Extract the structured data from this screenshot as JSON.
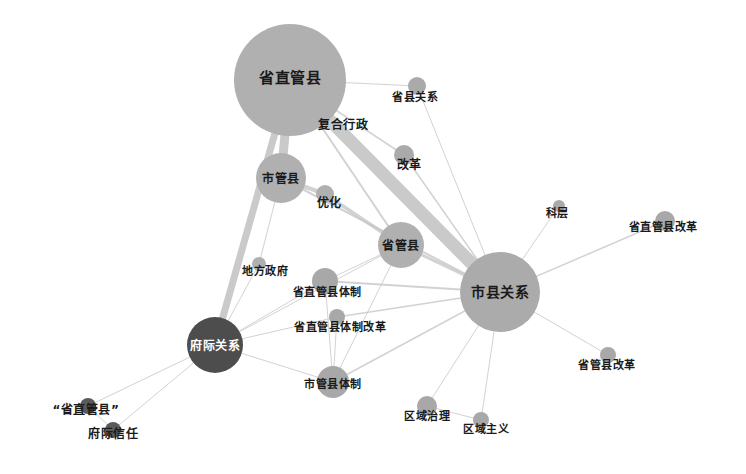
{
  "figure": {
    "type": "network-graph",
    "width": 746,
    "height": 474,
    "background": "#ffffff",
    "node_fill_light": "#b3b3b3",
    "node_fill_mid": "#9c9c9c",
    "node_fill_dark": "#4d4d4d",
    "edge_color": "#c8c8c8",
    "label_color": "#1a1a1a",
    "label_color_inverse": "#ffffff"
  },
  "chart_data": {
    "type": "network",
    "title": "",
    "nodes": [
      {
        "id": "sheng_zhi_guan_xian",
        "label": "省直管县",
        "x": 290,
        "y": 80,
        "r": 56,
        "fill": "#b0b0b0",
        "label_x": 290,
        "label_y": 76,
        "font_size": 15,
        "text_color": "dark"
      },
      {
        "id": "shi_guan_xian",
        "label": "市管县",
        "x": 281,
        "y": 178,
        "r": 25,
        "fill": "#b0b0b0",
        "label_x": 281,
        "label_y": 177,
        "font_size": 12,
        "text_color": "dark"
      },
      {
        "id": "sheng_guan_xian",
        "label": "省管县",
        "x": 401,
        "y": 245,
        "r": 23,
        "fill": "#b0b0b0",
        "label_x": 401,
        "label_y": 244,
        "font_size": 12,
        "text_color": "dark"
      },
      {
        "id": "shi_xian_guan_xi",
        "label": "市县关系",
        "x": 500,
        "y": 292,
        "r": 40,
        "fill": "#ababab",
        "label_x": 500,
        "label_y": 291,
        "font_size": 14,
        "text_color": "dark"
      },
      {
        "id": "fu_ji_guan_xi",
        "label": "府际关系",
        "x": 215,
        "y": 345,
        "r": 28,
        "fill": "#4d4d4d",
        "label_x": 215,
        "label_y": 344,
        "font_size": 12,
        "text_color": "light"
      },
      {
        "id": "sheng_xian_guan_xi",
        "label": "省县关系",
        "x": 417,
        "y": 86,
        "r": 9,
        "fill": "#aaaaaa",
        "label_x": 415,
        "label_y": 96,
        "font_size": 11,
        "text_color": "dark"
      },
      {
        "id": "gai_ge",
        "label": "改革",
        "x": 404,
        "y": 155,
        "r": 10,
        "fill": "#aaaaaa",
        "label_x": 409,
        "label_y": 163,
        "font_size": 12,
        "text_color": "dark"
      },
      {
        "id": "you_hua",
        "label": "优化",
        "x": 325,
        "y": 194,
        "r": 9,
        "fill": "#b0b0b0",
        "label_x": 329,
        "label_y": 201,
        "font_size": 12,
        "text_color": "dark"
      },
      {
        "id": "ke_ceng",
        "label": "科层",
        "x": 559,
        "y": 206,
        "r": 6,
        "fill": "#aaaaaa",
        "label_x": 557,
        "label_y": 212,
        "font_size": 11,
        "text_color": "dark"
      },
      {
        "id": "sheng_zhi_guan_xian_gai_ge",
        "label": "省直管县改革",
        "x": 665,
        "y": 221,
        "r": 10,
        "fill": "#a8a8a8",
        "label_x": 663,
        "label_y": 226,
        "font_size": 11,
        "text_color": "dark"
      },
      {
        "id": "di_fang_zheng_fu",
        "label": "地方政府",
        "x": 259,
        "y": 264,
        "r": 7,
        "fill": "#b0b0b0",
        "label_x": 265,
        "label_y": 270,
        "font_size": 11,
        "text_color": "dark"
      },
      {
        "id": "szgx_ti_zhi",
        "label": "省直管县体制",
        "x": 325,
        "y": 281,
        "r": 13,
        "fill": "#a8a8a8",
        "label_x": 327,
        "label_y": 291,
        "font_size": 11,
        "text_color": "dark"
      },
      {
        "id": "szgx_ti_zhi_gai_ge",
        "label": "省直管县体制改革",
        "x": 337,
        "y": 317,
        "r": 8,
        "fill": "#a8a8a8",
        "label_x": 340,
        "label_y": 326,
        "font_size": 11,
        "text_color": "dark"
      },
      {
        "id": "sgx_gai_ge",
        "label": "省管县改革",
        "x": 608,
        "y": 355,
        "r": 8,
        "fill": "#a8a8a8",
        "label_x": 607,
        "label_y": 364,
        "font_size": 11,
        "text_color": "dark"
      },
      {
        "id": "shi_guan_xian_ti_zhi",
        "label": "市管县体制",
        "x": 333,
        "y": 382,
        "r": 16,
        "fill": "#a8a8a8",
        "label_x": 333,
        "label_y": 383,
        "font_size": 11,
        "text_color": "dark"
      },
      {
        "id": "qu_yu_zhi_li",
        "label": "区域治理",
        "x": 427,
        "y": 406,
        "r": 10,
        "fill": "#a8a8a8",
        "label_x": 427,
        "label_y": 415,
        "font_size": 11,
        "text_color": "dark"
      },
      {
        "id": "qu_yu_zhu_yi",
        "label": "区域主义",
        "x": 481,
        "y": 420,
        "r": 8,
        "fill": "#a8a8a8",
        "label_x": 486,
        "label_y": 428,
        "font_size": 11,
        "text_color": "dark"
      },
      {
        "id": "szgx_quoted",
        "label": "“省直管县”",
        "x": 88,
        "y": 406,
        "r": 8,
        "fill": "#5a5a5a",
        "label_x": 86,
        "label_y": 408,
        "font_size": 12,
        "text_color": "dark"
      },
      {
        "id": "fu_ji_xin_ren",
        "label": "府际信任",
        "x": 113,
        "y": 430,
        "r": 8,
        "fill": "#5a5a5a",
        "label_x": 113,
        "label_y": 432,
        "font_size": 12,
        "text_color": "dark"
      },
      {
        "id": "fu_he_xing_zheng",
        "label": "复合行政",
        "x": 352,
        "y": 131,
        "r": 0,
        "fill": "#b0b0b0",
        "label_x": 343,
        "label_y": 123,
        "font_size": 12,
        "text_color": "dark"
      }
    ],
    "edges": [
      {
        "source": "sheng_zhi_guan_xian",
        "target": "shi_xian_guan_xi",
        "width": 13
      },
      {
        "source": "sheng_zhi_guan_xian",
        "target": "shi_guan_xian",
        "width": 9
      },
      {
        "source": "sheng_zhi_guan_xian",
        "target": "fu_ji_guan_xi",
        "width": 7
      },
      {
        "source": "sheng_zhi_guan_xian",
        "target": "sheng_guan_xian",
        "width": 2
      },
      {
        "source": "sheng_zhi_guan_xian",
        "target": "sheng_xian_guan_xi",
        "width": 1
      },
      {
        "source": "sheng_zhi_guan_xian",
        "target": "gai_ge",
        "width": 1.5
      },
      {
        "source": "shi_guan_xian",
        "target": "you_hua",
        "width": 4
      },
      {
        "source": "you_hua",
        "target": "sheng_guan_xian",
        "width": 3.5
      },
      {
        "source": "shi_guan_xian",
        "target": "shi_xian_guan_xi",
        "width": 2
      },
      {
        "source": "sheng_guan_xian",
        "target": "shi_xian_guan_xi",
        "width": 3
      },
      {
        "source": "gai_ge",
        "target": "shi_xian_guan_xi",
        "width": 1.5
      },
      {
        "source": "sheng_xian_guan_xi",
        "target": "shi_xian_guan_xi",
        "width": 1
      },
      {
        "source": "ke_ceng",
        "target": "shi_xian_guan_xi",
        "width": 1
      },
      {
        "source": "sheng_zhi_guan_xian_gai_ge",
        "target": "shi_xian_guan_xi",
        "width": 1.5
      },
      {
        "source": "sgx_gai_ge",
        "target": "shi_xian_guan_xi",
        "width": 1
      },
      {
        "source": "qu_yu_zhi_li",
        "target": "shi_xian_guan_xi",
        "width": 1
      },
      {
        "source": "qu_yu_zhu_yi",
        "target": "shi_xian_guan_xi",
        "width": 1
      },
      {
        "source": "shi_guan_xian_ti_zhi",
        "target": "shi_xian_guan_xi",
        "width": 1.5
      },
      {
        "source": "szgx_ti_zhi",
        "target": "shi_xian_guan_xi",
        "width": 2
      },
      {
        "source": "szgx_ti_zhi_gai_ge",
        "target": "shi_xian_guan_xi",
        "width": 1.5
      },
      {
        "source": "szgx_ti_zhi",
        "target": "sheng_guan_xian",
        "width": 1
      },
      {
        "source": "szgx_ti_zhi",
        "target": "fu_ji_guan_xi",
        "width": 1
      },
      {
        "source": "szgx_ti_zhi_gai_ge",
        "target": "fu_ji_guan_xi",
        "width": 1
      },
      {
        "source": "szgx_ti_zhi",
        "target": "shi_guan_xian_ti_zhi",
        "width": 1
      },
      {
        "source": "szgx_ti_zhi_gai_ge",
        "target": "shi_guan_xian_ti_zhi",
        "width": 1
      },
      {
        "source": "fu_ji_guan_xi",
        "target": "shi_guan_xian_ti_zhi",
        "width": 1
      },
      {
        "source": "fu_ji_guan_xi",
        "target": "di_fang_zheng_fu",
        "width": 1
      },
      {
        "source": "di_fang_zheng_fu",
        "target": "shi_guan_xian",
        "width": 1
      },
      {
        "source": "fu_ji_guan_xi",
        "target": "szgx_quoted",
        "width": 1
      },
      {
        "source": "fu_ji_guan_xi",
        "target": "fu_ji_xin_ren",
        "width": 1
      },
      {
        "source": "szgx_quoted",
        "target": "fu_ji_xin_ren",
        "width": 1
      },
      {
        "source": "fu_ji_guan_xi",
        "target": "sheng_guan_xian",
        "width": 1
      },
      {
        "source": "shi_guan_xian_ti_zhi",
        "target": "sheng_guan_xian",
        "width": 1
      },
      {
        "source": "qu_yu_zhi_li",
        "target": "qu_yu_zhu_yi",
        "width": 1
      }
    ],
    "legend": [],
    "xlabel": "",
    "ylabel": ""
  }
}
